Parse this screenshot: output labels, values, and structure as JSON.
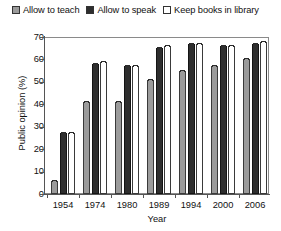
{
  "legend": {
    "position": "top",
    "entries": [
      {
        "label": "Allow to teach",
        "color": "#9b9b9b",
        "icon": "legend-swatch-icon"
      },
      {
        "label": "Allow to speak",
        "color": "#2e2e2e",
        "icon": "legend-swatch-icon"
      },
      {
        "label": "Keep books in library",
        "color": "#ffffff",
        "icon": "legend-swatch-icon"
      }
    ]
  },
  "axes": {
    "y_ticks": [
      "0",
      "10",
      "20",
      "30",
      "40",
      "50",
      "60",
      "70"
    ],
    "x_ticks": [
      "1954",
      "1974",
      "1980",
      "1989",
      "1994",
      "2000",
      "2006"
    ]
  },
  "chart_data": {
    "type": "bar",
    "title": "",
    "xlabel": "Year",
    "ylabel": "Public opinion (%)",
    "categories": [
      "1954",
      "1974",
      "1980",
      "1989",
      "1994",
      "2000",
      "2006"
    ],
    "series": [
      {
        "name": "Allow to teach",
        "color": "#9b9b9b",
        "values": [
          6,
          41,
          41,
          51,
          55,
          57,
          60
        ]
      },
      {
        "name": "Allow to speak",
        "color": "#2e2e2e",
        "values": [
          27,
          58,
          57,
          65,
          67,
          66,
          67
        ]
      },
      {
        "name": "Keep books in library",
        "color": "#ffffff",
        "values": [
          27,
          59,
          57,
          66,
          67,
          66,
          68
        ]
      }
    ],
    "ylim": [
      0,
      70
    ],
    "ytick_step": 10,
    "grid": false,
    "legend_position": "top"
  }
}
